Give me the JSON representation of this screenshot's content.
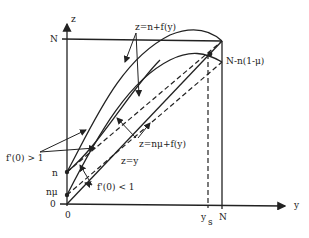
{
  "axes": {
    "vertical_label": "z",
    "horizontal_label": "y",
    "origin_x_label": "0",
    "origin_y_label": "0"
  },
  "ticks": {
    "z_N": "N",
    "z_n": "n",
    "z_nmu": "nμ",
    "y_ys": "y",
    "y_ys_sub": "s",
    "y_N": "N"
  },
  "annotations": {
    "upper_curve": "z=n+f(y)",
    "lower_curve": "z=nμ+f(y)",
    "diagonal": "z=y",
    "intersection": "N-n(1-μ)",
    "slope_gt": "f'(0) > 1",
    "slope_lt": "f'(0) < 1"
  },
  "colors": {
    "ink": "#222222",
    "background": "#ffffff"
  }
}
